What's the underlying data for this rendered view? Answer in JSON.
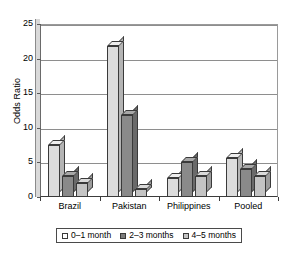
{
  "chart_data": {
    "type": "bar",
    "title": "",
    "xlabel": "",
    "ylabel": "Odds Ratio",
    "categories": [
      "Brazil",
      "Pakistan",
      "Philippines",
      "Pooled"
    ],
    "series": [
      {
        "name": "0–1 month",
        "values": [
          7.5,
          21.8,
          2.8,
          5.7
        ],
        "color": "#dcdcdc"
      },
      {
        "name": "2–3 months",
        "values": [
          3.1,
          11.9,
          5.0,
          4.0
        ],
        "color": "#8a8a8a"
      },
      {
        "name": "4–5 months",
        "values": [
          2.0,
          1.2,
          3.0,
          3.0
        ],
        "color": "#c4c4c4"
      }
    ],
    "ylim": [
      0,
      25
    ],
    "yticks": [
      0,
      5,
      10,
      15,
      20,
      25
    ],
    "ytick_labels": [
      "0",
      "5",
      "10",
      "15",
      "20",
      "25"
    ],
    "grid": "horizontal",
    "legend_position": "bottom",
    "style_3d": true
  },
  "axes": {
    "y_title": "Odds Ratio"
  },
  "legend": {
    "entries": [
      {
        "label": "0–1 month"
      },
      {
        "label": "2–3 months"
      },
      {
        "label": "4–5 months"
      }
    ]
  }
}
